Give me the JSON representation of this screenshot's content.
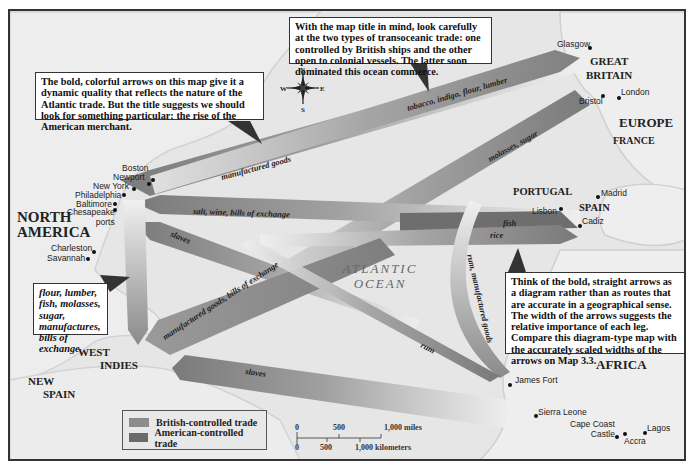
{
  "map": {
    "colors": {
      "background": "#e6e6e6",
      "land": "#ececec",
      "coast": "#cfcfcf",
      "british_trade": "#8c8c8c",
      "american_trade": "#6a6a6a",
      "frame": "#333333"
    },
    "compass": {
      "n": "N",
      "s": "S",
      "e": "E",
      "w": "W"
    },
    "ocean_label": {
      "line1": "ATLANTIC",
      "line2": "OCEAN"
    },
    "regions": {
      "north_america": {
        "line1": "NORTH",
        "line2": "AMERICA"
      },
      "west_indies": {
        "line1": "WEST",
        "line2": "INDIES"
      },
      "new_spain": {
        "line1": "NEW",
        "line2": "SPAIN"
      },
      "great_britain": {
        "line1": "GREAT",
        "line2": "BRITAIN"
      },
      "europe": "EUROPE",
      "france": "FRANCE",
      "portugal": "PORTUGAL",
      "spain": "SPAIN",
      "africa": "AFRICA"
    },
    "cities": {
      "boston": "Boston",
      "newport": "Newport",
      "new_york": "New York",
      "philadelphia": "Philadelphia",
      "baltimore": "Baltimore",
      "chesapeake": {
        "line1": "Chesapeake",
        "line2": "ports"
      },
      "charleston": "Charleston",
      "savannah": "Savannah",
      "glasgow": "Glasgow",
      "bristol": "Bristol",
      "london": "London",
      "lisbon": "Lisbon",
      "madrid": "Madrid",
      "cadiz": "Cadiz",
      "james_fort": "James Fort",
      "sierra_leone": "Sierra Leone",
      "cape_coast_castle": {
        "line1": "Cape Coast",
        "line2": "Castle"
      },
      "accra": "Accra",
      "lagos": "Lagos"
    },
    "trade_routes": [
      {
        "id": "manufactured-goods",
        "label": "manufactured goods",
        "control": "british",
        "from": "Great Britain",
        "to": "North America"
      },
      {
        "id": "tobacco-indigo",
        "label": "tobacco, indigo, flour, lumber",
        "control": "british",
        "from": "North America",
        "to": "Great Britain"
      },
      {
        "id": "molasses-sugar",
        "label": "molasses, sugar",
        "control": "british",
        "from": "West Indies",
        "to": "Great Britain"
      },
      {
        "id": "salt-wine",
        "label": "salt, wine, bills of exchange",
        "control": "american",
        "from": "Southern Europe",
        "to": "North America"
      },
      {
        "id": "slaves-na",
        "label": "slaves",
        "control": "american",
        "from": "Africa",
        "to": "North America"
      },
      {
        "id": "fish",
        "label": "fish",
        "control": "american",
        "from": "North America",
        "to": "Southern Europe"
      },
      {
        "id": "rice",
        "label": "rice",
        "control": "american",
        "from": "North America",
        "to": "Southern Europe"
      },
      {
        "id": "manufactured-bills",
        "label": "manufactured goods, bills of exchange",
        "control": "british",
        "from": "Great Britain",
        "to": "West Indies"
      },
      {
        "id": "rum-manufactured",
        "label": "rum, manufactured goods",
        "control": "american",
        "from": "North America",
        "to": "Africa"
      },
      {
        "id": "rum",
        "label": "rum",
        "control": "american",
        "from": "West Indies",
        "to": "Africa"
      },
      {
        "id": "slaves-wi",
        "label": "slaves",
        "control": "british",
        "from": "Africa",
        "to": "West Indies"
      },
      {
        "id": "colonial-exports",
        "label": "",
        "control": "american",
        "from": "North America",
        "to": "West Indies"
      }
    ],
    "callouts": {
      "top_left": "The bold, colorful arrows on this map give it a dynamic quality that reflects the nature of the Atlantic trade. But the title suggests we should look for something particular: the rise of the American merchant.",
      "top_center": "With the map title in mind, look carefully at the two types of transoceanic trade: one controlled by British ships and the other open to colonial vessels. The latter soon dominated this ocean commerce.",
      "left": "flour, lumber, fish, molasses, sugar, manufactures, bills of exchange",
      "right": "Think of the bold, straight arrows as a diagram rather than as routes that are accurate in a geographical sense. The width of the arrows suggests the relative importance of each leg. Compare this diagram-type map with the accurately scaled widths of the arrows on Map 3.3."
    },
    "legend": {
      "items": [
        {
          "label": "British-controlled trade",
          "color": "#8c8c8c"
        },
        {
          "label": "American-controlled trade",
          "color": "#6a6a6a"
        }
      ]
    },
    "scale_bar": {
      "miles": [
        "0",
        "500",
        "1,000 miles"
      ],
      "kilometers": [
        "0",
        "500",
        "1,000 kilometers"
      ]
    }
  }
}
